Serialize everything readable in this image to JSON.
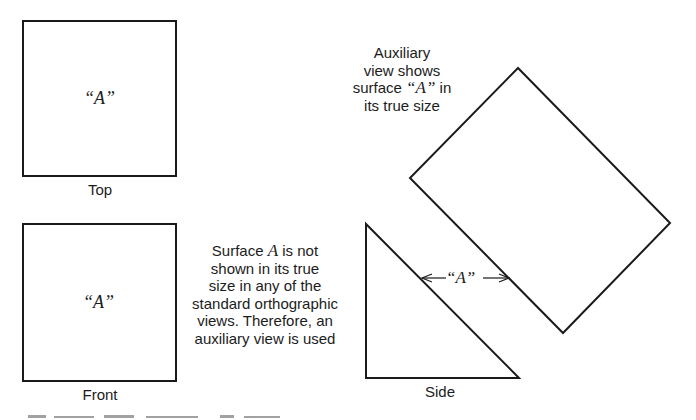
{
  "figure": {
    "views": {
      "top": {
        "label": "Top",
        "surface_label": "“A”"
      },
      "front": {
        "label": "Front",
        "surface_label": "“A”"
      },
      "side": {
        "label": "Side",
        "surface_label": "“A”"
      }
    },
    "auxiliary_note": {
      "lines": [
        "Auxiliary",
        "view shows",
        "surface “A” in",
        "its true size"
      ],
      "line3_pre": "surface ",
      "line3_em": "“A”",
      "line3_post": " in"
    },
    "surface_note": {
      "line1_pre": "Surface ",
      "line1_em": "A",
      "line1_post": " is not",
      "line2": "shown in its true",
      "line3": "size in any of the",
      "line4": "standard orthographic",
      "line5": "views. Therefore, an",
      "line6": "auxiliary view is used"
    },
    "colors": {
      "stroke": "#1a1a1a",
      "background": "#ffffff"
    }
  }
}
